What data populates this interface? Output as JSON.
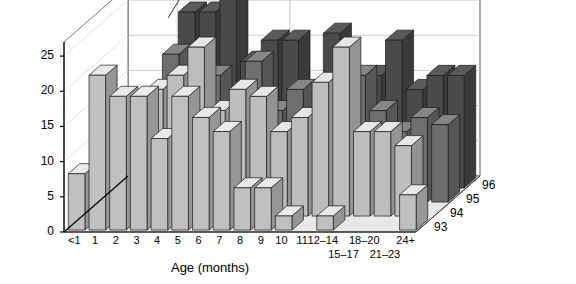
{
  "chart_data": {
    "type": "bar",
    "title": "",
    "ylabel": "Patients",
    "xlabel": "Age (months)",
    "zlabel": "",
    "grid": true,
    "legend_position": "depth-axis",
    "ylim": [
      0,
      27
    ],
    "yticks": [
      0,
      5,
      10,
      15,
      20,
      25
    ],
    "categories": [
      "<1",
      "1",
      "2",
      "3",
      "4",
      "5",
      "6",
      "7",
      "8",
      "9",
      "10",
      "11",
      "12–14",
      "15–17",
      "18–20",
      "21–23",
      "24+"
    ],
    "depth_categories": [
      "93",
      "94",
      "95",
      "96"
    ],
    "series": [
      {
        "name": "93",
        "color": "#c0c0c0",
        "values": [
          8,
          22,
          19,
          19,
          13,
          19,
          16,
          14,
          6,
          6,
          2,
          0,
          2,
          0,
          0,
          0,
          5
        ]
      },
      {
        "name": "94",
        "color": "#bdbdbd",
        "values": [
          0,
          0,
          14,
          18,
          20,
          24,
          15,
          18,
          17,
          12,
          14,
          19,
          24,
          12,
          12,
          10,
          0
        ]
      },
      {
        "name": "95",
        "color": "#6e6e6e",
        "values": [
          0,
          0,
          15,
          21,
          19,
          18,
          14,
          20,
          13,
          16,
          13,
          13,
          18,
          13,
          10,
          12,
          11
        ]
      },
      {
        "name": "96",
        "color": "#4a4a4a",
        "values": [
          0,
          0,
          0,
          25,
          25,
          27,
          18,
          21,
          21,
          14,
          22,
          15,
          16,
          21,
          14,
          16,
          16
        ]
      }
    ]
  },
  "yticks_labels": {
    "t0": "0",
    "t5": "5",
    "t10": "10",
    "t15": "15",
    "t20": "20",
    "t25": "25"
  },
  "xticks_labels": {
    "c0": "<1",
    "c1": "1",
    "c2": "2",
    "c3": "3",
    "c4": "4",
    "c5": "5",
    "c6": "6",
    "c7": "7",
    "c8": "8",
    "c9": "9",
    "c10": "10",
    "c11": "11",
    "c12": "12–14",
    "c13": "15–17",
    "c14": "18–20",
    "c15": "21–23",
    "c16": "24+"
  },
  "zticks_labels": {
    "z0": "93",
    "z1": "94",
    "z2": "95",
    "z3": "96"
  },
  "labels": {
    "ylabel": "Patients",
    "xlabel": "Age (months)"
  },
  "colors": {
    "series_93": "#c0c0c0",
    "series_94": "#bdbdbd",
    "series_95": "#6e6e6e",
    "series_96": "#4a4a4a",
    "floor": "#e8e8e8",
    "wall": "#ffffff",
    "gridline": "#c8c8c8",
    "outline": "#000000"
  }
}
